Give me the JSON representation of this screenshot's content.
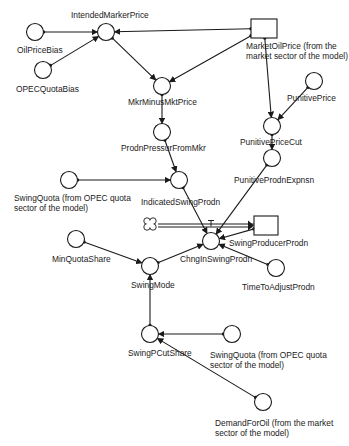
{
  "diagram": {
    "type": "stock-and-flow causal diagram",
    "colors": {
      "stroke": "#1a1a1a",
      "background": "#ffffff",
      "text": "#222222"
    },
    "nodes": [
      {
        "id": "oil_price_bias",
        "kind": "auxiliary",
        "label": "OilPriceBias",
        "cx": 35,
        "cy": 32
      },
      {
        "id": "opec_quota_bias",
        "kind": "auxiliary",
        "label": "OPECQuotaBias",
        "cx": 43,
        "cy": 70
      },
      {
        "id": "intended_marker_price",
        "kind": "auxiliary",
        "label": "IntendedMarkerPrice",
        "cx": 106,
        "cy": 32
      },
      {
        "id": "market_oil_price",
        "kind": "stock",
        "label_lines": [
          "MarketOilPrice (from the",
          "market sector of the model)"
        ],
        "x": 251,
        "y": 19,
        "w": 26,
        "h": 19
      },
      {
        "id": "mkr_minus_mkt_price",
        "kind": "auxiliary",
        "label": "MkrMinusMktPrice",
        "cx": 162,
        "cy": 86
      },
      {
        "id": "prodn_pressur_from_mkr",
        "kind": "auxiliary",
        "label": "ProdnPressurFromMkr",
        "cx": 162,
        "cy": 132
      },
      {
        "id": "punitive_price",
        "kind": "auxiliary",
        "label": "PunitivePrice",
        "cx": 314,
        "cy": 81
      },
      {
        "id": "punitive_price_cut",
        "kind": "auxiliary",
        "label": "PunitivePriceCut",
        "cx": 272,
        "cy": 126
      },
      {
        "id": "punitive_prodn_expnsn",
        "kind": "auxiliary",
        "label": "PunitiveProdnExpnsn",
        "cx": 272,
        "cy": 158
      },
      {
        "id": "swing_quota_1",
        "kind": "auxiliary",
        "label_lines": [
          "SwingQuota (from OPEC quota",
          "sector of the model)"
        ],
        "cx": 69,
        "cy": 180
      },
      {
        "id": "indicated_swing_prodn",
        "kind": "auxiliary",
        "label": "IndicatedSwingProdn",
        "cx": 179,
        "cy": 180
      },
      {
        "id": "source_cloud",
        "kind": "cloud",
        "cx": 150,
        "cy": 224
      },
      {
        "id": "swing_producer_prodn",
        "kind": "stock",
        "label": "SwingProducerProdn",
        "x": 254,
        "y": 216,
        "w": 24,
        "h": 19
      },
      {
        "id": "chng_in_swing_prodn",
        "kind": "flow",
        "label": "ChngInSwingProdn",
        "cx": 211,
        "cy": 241
      },
      {
        "id": "time_to_adjust_prodn",
        "kind": "auxiliary",
        "label": "TimeToAdjustProdn",
        "cx": 276,
        "cy": 268
      },
      {
        "id": "min_quota_share",
        "kind": "auxiliary",
        "label": "MinQuotaShare",
        "cx": 76,
        "cy": 239
      },
      {
        "id": "swing_mode",
        "kind": "auxiliary",
        "label": "SwingMode",
        "cx": 150,
        "cy": 266
      },
      {
        "id": "swing_p_cut_share",
        "kind": "auxiliary",
        "label": "SwingPCutShare",
        "cx": 150,
        "cy": 334
      },
      {
        "id": "swing_quota_2",
        "kind": "auxiliary",
        "label_lines": [
          "SwingQuota (from OPEC quota",
          "sector of the model)"
        ],
        "cx": 232,
        "cy": 334
      },
      {
        "id": "demand_for_oil",
        "kind": "auxiliary",
        "label_lines": [
          "DemandForOil (from the market",
          "sector of the model)"
        ],
        "cx": 263,
        "cy": 402
      }
    ],
    "links": [
      {
        "from": "oil_price_bias",
        "to": "intended_marker_price"
      },
      {
        "from": "opec_quota_bias",
        "to": "intended_marker_price"
      },
      {
        "from": "market_oil_price",
        "to": "intended_marker_price"
      },
      {
        "from": "intended_marker_price",
        "to": "mkr_minus_mkt_price"
      },
      {
        "from": "market_oil_price",
        "to": "mkr_minus_mkt_price"
      },
      {
        "from": "market_oil_price",
        "to": "punitive_price_cut"
      },
      {
        "from": "punitive_price",
        "to": "punitive_price_cut"
      },
      {
        "from": "punitive_price_cut",
        "to": "punitive_prodn_expnsn"
      },
      {
        "from": "mkr_minus_mkt_price",
        "to": "prodn_pressur_from_mkr"
      },
      {
        "from": "prodn_pressur_from_mkr",
        "to": "indicated_swing_prodn"
      },
      {
        "from": "swing_quota_1",
        "to": "indicated_swing_prodn"
      },
      {
        "from": "indicated_swing_prodn",
        "to": "chng_in_swing_prodn"
      },
      {
        "from": "punitive_prodn_expnsn",
        "to": "chng_in_swing_prodn"
      },
      {
        "from": "swing_producer_prodn",
        "to": "chng_in_swing_prodn"
      },
      {
        "from": "time_to_adjust_prodn",
        "to": "chng_in_swing_prodn"
      },
      {
        "from": "swing_mode",
        "to": "chng_in_swing_prodn"
      },
      {
        "from": "min_quota_share",
        "to": "swing_mode"
      },
      {
        "from": "swing_p_cut_share",
        "to": "swing_mode"
      },
      {
        "from": "swing_quota_2",
        "to": "swing_p_cut_share"
      },
      {
        "from": "demand_for_oil",
        "to": "swing_p_cut_share"
      }
    ],
    "flows": [
      {
        "from": "source_cloud",
        "to": "swing_producer_prodn",
        "valve": "chng_in_swing_prodn"
      }
    ]
  }
}
